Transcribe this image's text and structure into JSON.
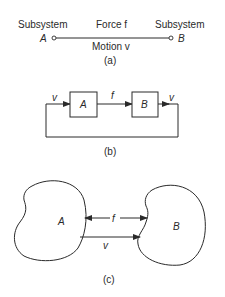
{
  "panel_a": {
    "left_label": "Subsystem",
    "right_label": "Subsystem",
    "left_node": "A",
    "right_node": "B",
    "top_label": "Force f",
    "bottom_label": "Motion v",
    "caption": "(a)"
  },
  "panel_b": {
    "block_a": "A",
    "block_b": "B",
    "input_label": "v",
    "middle_label": "f",
    "output_label": "v",
    "caption": "(b)"
  },
  "panel_c": {
    "body_a": "A",
    "body_b": "B",
    "force_label": "f",
    "motion_label": "v",
    "caption": "(c)"
  },
  "colors": {
    "ink": "#2a2a2a",
    "background": "#ffffff"
  }
}
